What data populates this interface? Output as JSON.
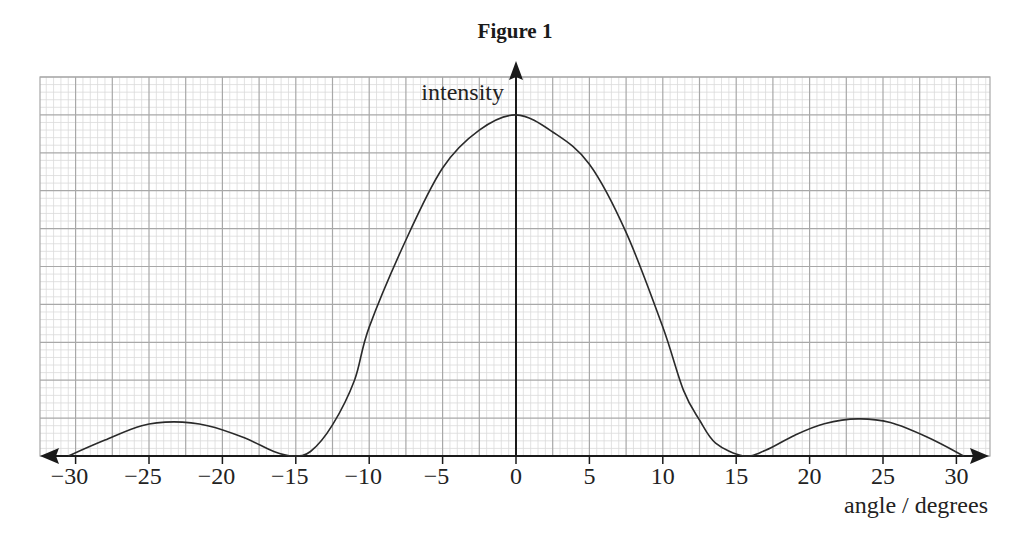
{
  "chart_data": {
    "type": "line",
    "title": "Figure 1",
    "xlabel": "angle / degrees",
    "ylabel": "intensity",
    "xlim": [
      -32,
      32
    ],
    "ylim": [
      0,
      10
    ],
    "x_ticks": [
      -30,
      -25,
      -20,
      -15,
      -10,
      -5,
      0,
      5,
      10,
      15,
      20,
      25,
      30
    ],
    "x_tick_labels": [
      "−30",
      "−25",
      "−20",
      "−15",
      "−10",
      "−5",
      "0",
      "5",
      "10",
      "15",
      "20",
      "25",
      "30"
    ],
    "y_ticks_labeled": false,
    "grid": true,
    "grid_major_x_step": 2.5,
    "grid_major_y_step": 1,
    "grid_minor_divisions": 5,
    "legend": null,
    "series": [
      {
        "name": "intensity",
        "x": [
          -30.5,
          -28,
          -25.5,
          -23.3,
          -21,
          -18.5,
          -16.5,
          -15.2,
          -14,
          -12.5,
          -11,
          -10,
          -7.5,
          -5,
          -2.5,
          0,
          2.5,
          5,
          7.5,
          10,
          11.4,
          12.5,
          13.6,
          15.5,
          17,
          19,
          21,
          23.3,
          25.5,
          28,
          30.5
        ],
        "y": [
          0,
          0.42,
          0.8,
          0.9,
          0.8,
          0.48,
          0.12,
          0,
          0.12,
          0.82,
          2.0,
          3.4,
          5.7,
          7.6,
          8.6,
          9.0,
          8.55,
          7.7,
          5.9,
          3.4,
          1.74,
          0.95,
          0.34,
          0,
          0.15,
          0.55,
          0.85,
          0.98,
          0.88,
          0.5,
          0
        ]
      }
    ],
    "annotations": [
      "central maximum at 0 degrees",
      "first minima near ±15 degrees",
      "secondary maxima near ±23 degrees"
    ]
  },
  "colors": {
    "background": "#ffffff",
    "grid_minor": "#dadada",
    "grid_major": "#a8a8a8",
    "axis": "#1a1a1a",
    "curve": "#2a2a2a",
    "text": "#222222"
  }
}
